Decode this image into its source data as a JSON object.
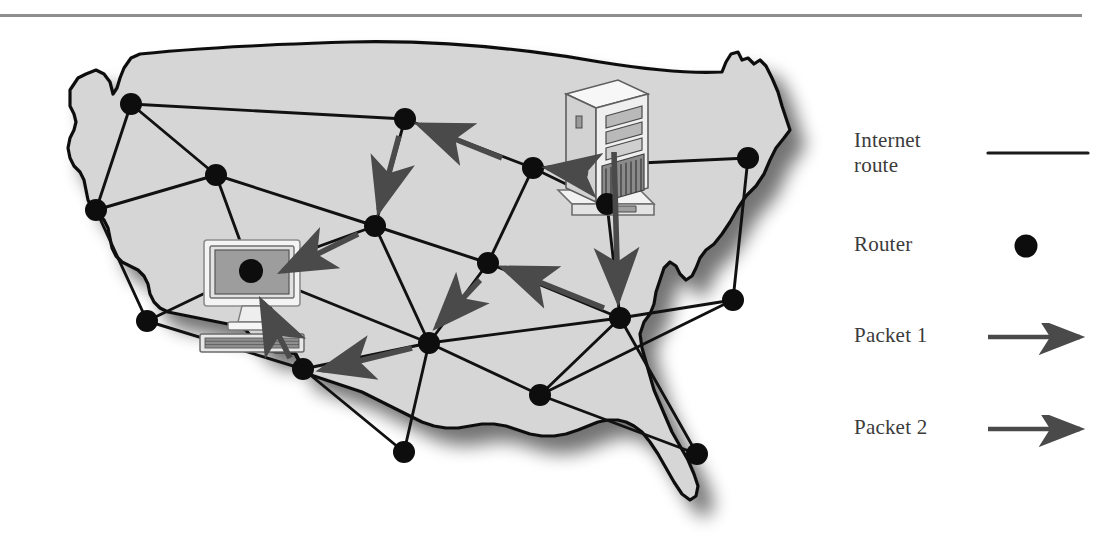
{
  "figure": {
    "kind": "network-diagram",
    "background_color": "#ffffff",
    "rule_color": "#8e8e8e"
  },
  "map": {
    "name": "united-states-outline",
    "fill_color": "#d6d6d6",
    "outline_color": "#111111",
    "shadow_color": "#9a9a9a"
  },
  "legend": {
    "rows": [
      {
        "id": "internet-route",
        "label": "Internet\nroute",
        "label_line1": "Internet",
        "label_line2": "route",
        "symbol": "line",
        "color": "#1a1a1a"
      },
      {
        "id": "router",
        "label": "Router",
        "symbol": "dot",
        "color": "#0d0d0d"
      },
      {
        "id": "packet-1",
        "label": "Packet 1",
        "symbol": "arrow",
        "color": "#4a4a4a"
      },
      {
        "id": "packet-2",
        "label": "Packet 2",
        "symbol": "arrow",
        "color": "#4a4a4a"
      }
    ]
  },
  "devices": [
    {
      "id": "server",
      "name": "tower-server",
      "role": "source",
      "position": {
        "x": 607,
        "y": 140
      }
    },
    {
      "id": "desktop",
      "name": "desktop-computer",
      "role": "destination",
      "position": {
        "x": 250,
        "y": 265
      }
    }
  ],
  "routers": [
    {
      "id": "r1",
      "x": 131,
      "y": 86
    },
    {
      "id": "r2",
      "x": 216,
      "y": 157
    },
    {
      "id": "r3",
      "x": 96,
      "y": 192
    },
    {
      "id": "r4",
      "x": 405,
      "y": 101
    },
    {
      "id": "r5",
      "x": 533,
      "y": 150
    },
    {
      "id": "r6",
      "x": 748,
      "y": 140
    },
    {
      "id": "r7",
      "x": 607,
      "y": 186
    },
    {
      "id": "r8",
      "x": 375,
      "y": 208
    },
    {
      "id": "r9",
      "x": 488,
      "y": 245
    },
    {
      "id": "r10",
      "x": 251,
      "y": 253
    },
    {
      "id": "r11",
      "x": 147,
      "y": 303
    },
    {
      "id": "r12",
      "x": 620,
      "y": 300
    },
    {
      "id": "r13",
      "x": 733,
      "y": 282
    },
    {
      "id": "r14",
      "x": 429,
      "y": 325
    },
    {
      "id": "r15",
      "x": 303,
      "y": 351
    },
    {
      "id": "r16",
      "x": 540,
      "y": 377
    },
    {
      "id": "r17",
      "x": 404,
      "y": 434
    },
    {
      "id": "r18",
      "x": 697,
      "y": 436
    }
  ],
  "links": [
    [
      "r1",
      "r2"
    ],
    [
      "r1",
      "r3"
    ],
    [
      "r1",
      "r4"
    ],
    [
      "r2",
      "r3"
    ],
    [
      "r2",
      "r8"
    ],
    [
      "r2",
      "r10"
    ],
    [
      "r3",
      "r11"
    ],
    [
      "r4",
      "r5"
    ],
    [
      "r4",
      "r8"
    ],
    [
      "r5",
      "r6"
    ],
    [
      "r5",
      "r7"
    ],
    [
      "r5",
      "r9"
    ],
    [
      "r6",
      "r13"
    ],
    [
      "r7",
      "r12"
    ],
    [
      "r8",
      "r9"
    ],
    [
      "r8",
      "r10"
    ],
    [
      "r8",
      "r14"
    ],
    [
      "r9",
      "r12"
    ],
    [
      "r9",
      "r14"
    ],
    [
      "r10",
      "r11"
    ],
    [
      "r10",
      "r14"
    ],
    [
      "r10",
      "r15"
    ],
    [
      "r11",
      "r15"
    ],
    [
      "r12",
      "r13"
    ],
    [
      "r12",
      "r14"
    ],
    [
      "r12",
      "r16"
    ],
    [
      "r12",
      "r18"
    ],
    [
      "r13",
      "r16"
    ],
    [
      "r14",
      "r15"
    ],
    [
      "r14",
      "r16"
    ],
    [
      "r14",
      "r17"
    ],
    [
      "r16",
      "r18"
    ],
    [
      "r15",
      "r17"
    ]
  ],
  "packets": [
    {
      "id": "packet-1",
      "label": "Packet 1",
      "color": "#4a4a4a",
      "hops": [
        {
          "from": "server",
          "to": "r5"
        },
        {
          "from": "r5",
          "to": "r4"
        },
        {
          "from": "r4",
          "to": "r8"
        },
        {
          "from": "r8",
          "to": "desktop"
        }
      ]
    },
    {
      "id": "packet-2",
      "label": "Packet 2",
      "color": "#4a4a4a",
      "hops": [
        {
          "from": "server",
          "to": "r12"
        },
        {
          "from": "r12",
          "to": "r9"
        },
        {
          "from": "r9",
          "to": "r14"
        },
        {
          "from": "r14",
          "to": "r15"
        },
        {
          "from": "r15",
          "to": "desktop"
        }
      ]
    }
  ]
}
